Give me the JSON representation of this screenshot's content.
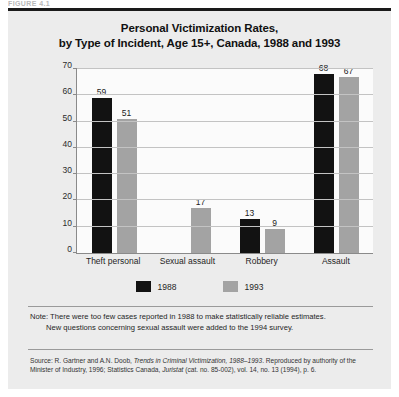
{
  "figure_label": "FIGURE 4.1",
  "title": {
    "line1": "Personal Victimization Rates,",
    "line2": "by Type of Incident, Age 15+, Canada, 1988 and 1993"
  },
  "legend": {
    "items": [
      {
        "label": "1988",
        "color": "#121212"
      },
      {
        "label": "1993",
        "color": "#a3a3a3"
      }
    ]
  },
  "note": {
    "line1": "Note: There were too few cases reported in 1988 to make statistically reliable estimates.",
    "line2": "New questions concerning sexual assault were added to the 1994 survey."
  },
  "source": {
    "prefix": "Source: R. Gartner and A.N. Doob, ",
    "italic1": "Trends in Criminal Victimization, 1988–1993",
    "middle": ". Reproduced by authority of the Minister of Industry, 1996; Statistics Canada, ",
    "italic2": "Juristat",
    "suffix": " (cat. no. 85-002), vol. 14, no. 13 (1994), p. 6."
  },
  "chart_data": {
    "type": "bar",
    "title": "Personal Victimization Rates, by Type of Incident, Age 15+, Canada, 1988 and 1993",
    "xlabel": "",
    "ylabel": "Rate per 1000 population",
    "ylim": [
      0,
      70
    ],
    "yticks": [
      0,
      10,
      20,
      30,
      40,
      50,
      60,
      70
    ],
    "grid": true,
    "legend_position": "bottom",
    "categories": [
      "Theft personal",
      "Sexual assault",
      "Robbery",
      "Assault"
    ],
    "series": [
      {
        "name": "1988",
        "color": "#121212",
        "values": [
          59,
          null,
          13,
          68
        ]
      },
      {
        "name": "1993",
        "color": "#a3a3a3",
        "values": [
          51,
          17,
          9,
          67
        ]
      }
    ]
  }
}
